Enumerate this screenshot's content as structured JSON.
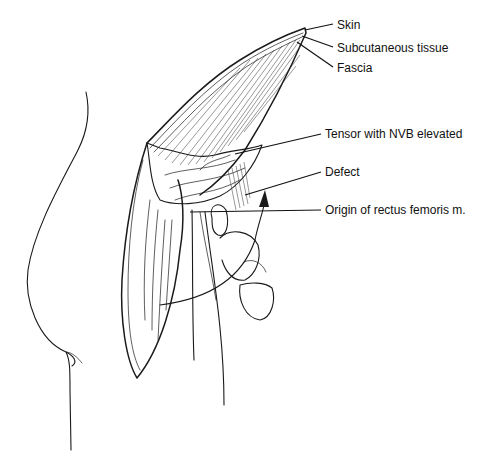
{
  "figure": {
    "type": "surgical-illustration",
    "colors": {
      "ink": "#1a1a1a",
      "background": "#ffffff"
    },
    "labels": [
      {
        "id": "skin",
        "text": "Skin",
        "x": 337,
        "y": 28
      },
      {
        "id": "subcutaneous",
        "text": "Subcutaneous tissue",
        "x": 337,
        "y": 52
      },
      {
        "id": "fascia",
        "text": "Fascia",
        "x": 337,
        "y": 71
      },
      {
        "id": "tensor",
        "text": "Tensor with NVB elevated",
        "x": 325,
        "y": 129
      },
      {
        "id": "defect",
        "text": "Defect",
        "x": 325,
        "y": 166
      },
      {
        "id": "origin-rectus",
        "text": "Origin of rectus femoris m.",
        "x": 325,
        "y": 205
      }
    ]
  }
}
